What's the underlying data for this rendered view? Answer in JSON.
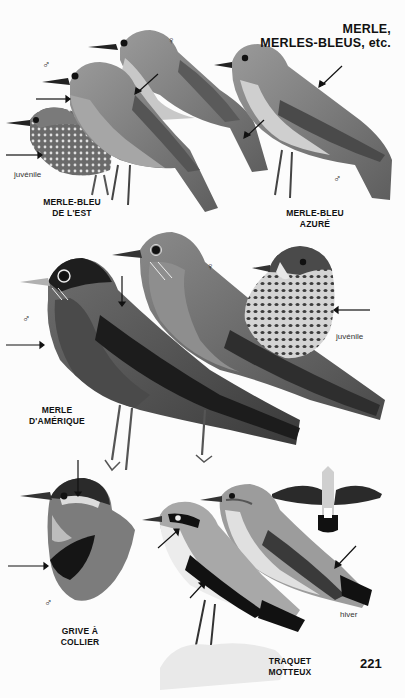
{
  "page": {
    "title_line1": "MERLE,",
    "title_line2": "MERLES-BLEUS, etc.",
    "page_number": "221"
  },
  "symbols": {
    "male": "♂",
    "female": "♀"
  },
  "plates": [
    {
      "id": "merle-bleu-est",
      "name_line1": "MERLE-BLEU",
      "name_line2": "DE L'EST",
      "figures": [
        {
          "sex": "male"
        },
        {
          "sex": "female"
        },
        {
          "note": "juvénile"
        }
      ]
    },
    {
      "id": "merle-bleu-azure",
      "name_line1": "MERLE-BLEU",
      "name_line2": "AZURÉ",
      "figures": [
        {
          "sex": "male"
        }
      ]
    },
    {
      "id": "merle-amerique",
      "name_line1": "MERLE",
      "name_line2": "D'AMÉRIQUE",
      "figures": [
        {
          "sex": "male"
        },
        {
          "sex": "female"
        },
        {
          "note": "juvénile"
        }
      ]
    },
    {
      "id": "grive-collier",
      "name_line1": "GRIVE À",
      "name_line2": "COLLIER",
      "figures": [
        {
          "sex": "male"
        }
      ]
    },
    {
      "id": "traquet-motteux",
      "name_line1": "TRAQUET",
      "name_line2": "MOTTEUX",
      "figures": [
        {
          "note": "hiver"
        }
      ]
    }
  ]
}
